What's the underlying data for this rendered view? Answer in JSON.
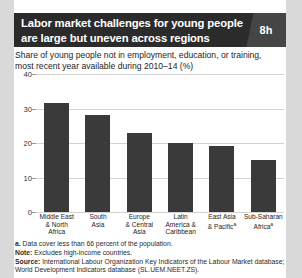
{
  "figure": {
    "title_line1": "Labor market challenges for young people",
    "title_line2": "are large but uneven across regions",
    "figure_number": "8h",
    "subtitle_line1": "Share of young people not in employment, education, or training,",
    "subtitle_line2": "most recent year available during 2010–14 (%)",
    "footnote_marker": "a.",
    "footnote_text": "Data cover less than 66 percent of the population.",
    "note_label": "Note:",
    "note_text": "Excludes high-income countries.",
    "source_label": "Source:",
    "source_text": "International Labour Organization Key Indicators of the Labour Market database; World Development Indicators database (SL.UEM.NEET.ZS).",
    "colors": {
      "bar": "#3a3a3a",
      "title_bar": "#2b2b2b",
      "fignum_box": "#454545",
      "page_background": "#d9d9d9",
      "grid": "#d2d2d2"
    }
  },
  "chart_data": {
    "type": "bar",
    "title": "Labor market challenges for young people are large but uneven across regions",
    "subtitle": "Share of young people not in employment, education, or training, most recent year available during 2010–14 (%)",
    "categories": [
      "Middle East & North Africa",
      "South Asia",
      "Europe & Central Asia",
      "Latin America & Caribbean",
      "East Asia & Pacific",
      "Sub-Saharan Africa"
    ],
    "category_lines": [
      [
        "Middle East",
        "& North",
        "Africa"
      ],
      [
        "South",
        "Asia"
      ],
      [
        "Europe",
        "& Central",
        "Asia"
      ],
      [
        "Latin",
        "America &",
        "Caribbean"
      ],
      [
        "East Asia",
        "& Pacific"
      ],
      [
        "Sub-Saharan",
        "Africa"
      ]
    ],
    "category_footnotes": [
      "",
      "",
      "",
      "",
      "a",
      "a"
    ],
    "values": [
      31.5,
      28.0,
      23.0,
      20.0,
      19.0,
      15.0
    ],
    "xlabel": "",
    "ylabel": "",
    "ylim": [
      0,
      40
    ],
    "yticks": [
      0,
      10,
      20,
      30,
      40
    ],
    "ytick_labels": [
      "0",
      "10",
      "20",
      "30",
      "40"
    ],
    "grid": true,
    "legend": false
  }
}
